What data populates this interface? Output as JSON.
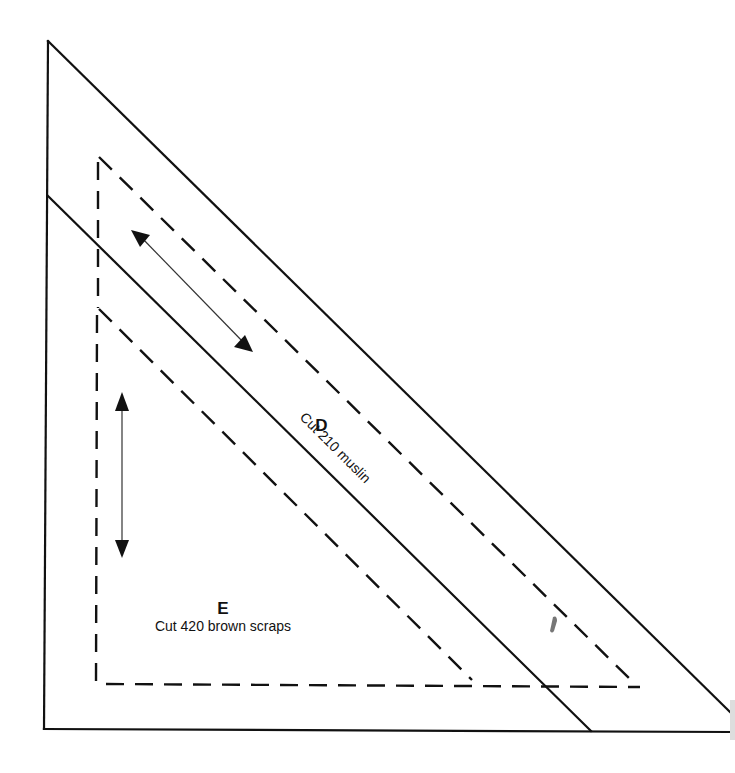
{
  "diagram": {
    "type": "quilt-template",
    "pieces": [
      {
        "id": "D",
        "letter": "D",
        "instruction": "Cut 210 muslin",
        "grain_arrow": "diagonal"
      },
      {
        "id": "E",
        "letter": "E",
        "instruction": "Cut 420 brown scraps",
        "grain_arrow": "vertical"
      }
    ],
    "legend": {
      "solid_line": "cutting line",
      "dashed_line": "sewing line",
      "double_arrow": "grain line"
    },
    "colors": {
      "line": "#111111",
      "background": "#ffffff"
    }
  }
}
